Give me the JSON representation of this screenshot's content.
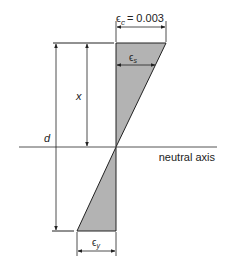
{
  "diagram": {
    "labels": {
      "epsilon_c": "ϵ",
      "epsilon_c_sub": "c",
      "epsilon_c_value": "= 0.003",
      "epsilon_s": "ϵ",
      "epsilon_s_sub": "s",
      "epsilon_y": "ϵ",
      "epsilon_y_sub": "y",
      "x": "x",
      "d": "d",
      "neutral_axis": "neutral axis"
    },
    "colors": {
      "fill": "#b3b3b3",
      "line": "#222222"
    }
  }
}
